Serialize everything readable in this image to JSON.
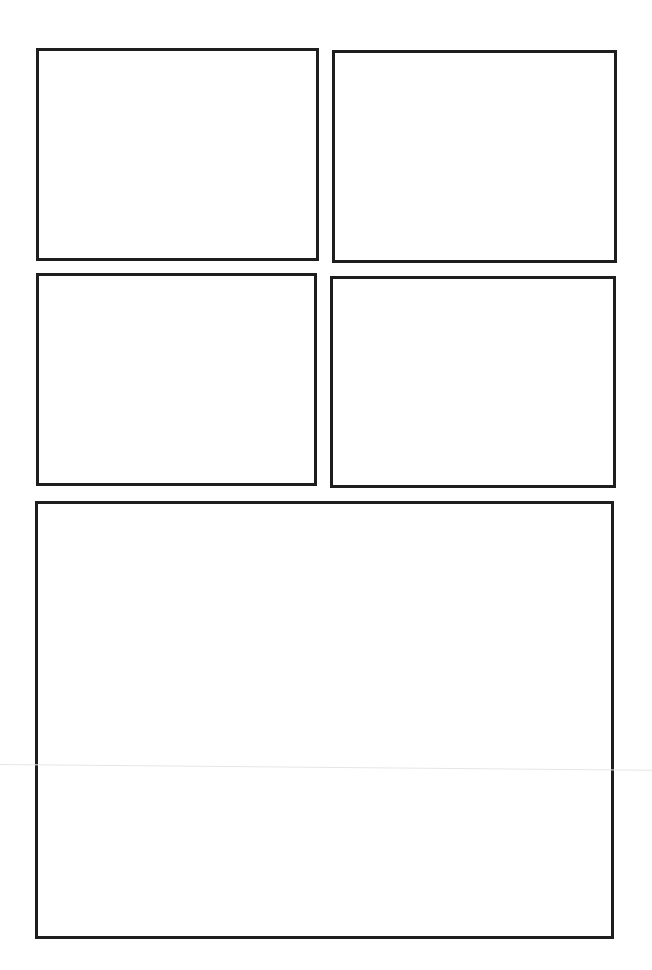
{
  "page": {
    "type": "blank-comic-template",
    "background_color": "#ffffff",
    "border_color": "#1e1e1e"
  },
  "panels": [
    {
      "id": 1,
      "label": "",
      "left": 36,
      "top": 48,
      "width": 283,
      "height": 213
    },
    {
      "id": 2,
      "label": "",
      "left": 332,
      "top": 50,
      "width": 285,
      "height": 213
    },
    {
      "id": 3,
      "label": "",
      "left": 36,
      "top": 273,
      "width": 281,
      "height": 213
    },
    {
      "id": 4,
      "label": "",
      "left": 330,
      "top": 276,
      "width": 286,
      "height": 212
    },
    {
      "id": 5,
      "label": "",
      "left": 35,
      "top": 501,
      "width": 579,
      "height": 438
    }
  ]
}
